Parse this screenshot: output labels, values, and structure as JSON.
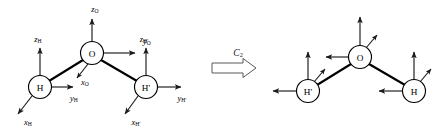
{
  "figure": {
    "background_color": "#ffffff",
    "line_color": "#000000"
  },
  "left_molecule": {
    "name": "water-before-rotation",
    "atoms": [
      {
        "id": "O",
        "label": "O",
        "cx": 92,
        "cy": 53,
        "r": 11.5
      },
      {
        "id": "H",
        "label": "H",
        "cx": 40,
        "cy": 87,
        "r": 11.5
      },
      {
        "id": "Hp",
        "label": "H'",
        "cx": 146,
        "cy": 87,
        "r": 11.5
      }
    ],
    "bonds": [
      {
        "from": "O",
        "to": "H"
      },
      {
        "from": "O",
        "to": "Hp"
      }
    ],
    "axis_labels": [
      {
        "id": "zO",
        "letter": "z",
        "sub": "O",
        "x": 95,
        "y": 9
      },
      {
        "id": "yO",
        "letter": "y",
        "sub": "O",
        "x": 147,
        "y": 41
      },
      {
        "id": "xO",
        "letter": "x",
        "sub": "O",
        "x": 85,
        "y": 82
      },
      {
        "id": "zH",
        "letter": "z",
        "sub": "H",
        "x": 38,
        "y": 39
      },
      {
        "id": "yH",
        "letter": "y",
        "sub": "H",
        "x": 74,
        "y": 98
      },
      {
        "id": "xH",
        "letter": "x",
        "sub": "H",
        "x": 28,
        "y": 122
      },
      {
        "id": "zHp",
        "letter": "z",
        "sub": "H'",
        "x": 144,
        "y": 39
      },
      {
        "id": "yHp",
        "letter": "y",
        "sub": "H'",
        "x": 182,
        "y": 98
      },
      {
        "id": "xHp",
        "letter": "x",
        "sub": "H'",
        "x": 136,
        "y": 122
      }
    ]
  },
  "operation": {
    "name": "c2-rotation-operator",
    "letter": "C",
    "sub": "2",
    "label_x": 238,
    "label_y": 58,
    "arrow_x": 212,
    "arrow_y": 68
  },
  "right_molecule": {
    "name": "water-after-rotation",
    "atoms": [
      {
        "id": "O",
        "label": "O",
        "cx": 360,
        "cy": 57,
        "r": 11.5
      },
      {
        "id": "Hp",
        "label": "H'",
        "cx": 308,
        "cy": 91,
        "r": 11.5
      },
      {
        "id": "H",
        "label": "H",
        "cx": 414,
        "cy": 91,
        "r": 11.5
      }
    ],
    "bonds": [
      {
        "from": "O",
        "to": "Hp"
      },
      {
        "from": "O",
        "to": "H"
      }
    ],
    "axis_labels": []
  }
}
